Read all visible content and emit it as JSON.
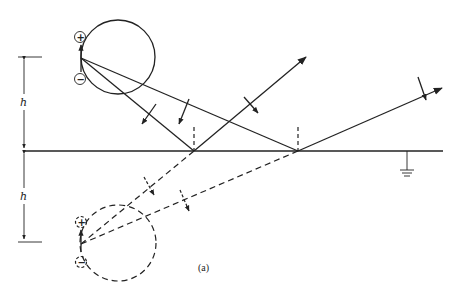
{
  "diagram": {
    "caption": "(a)",
    "height_label_upper": "h",
    "height_label_lower": "h",
    "ground_plane": {
      "y": 151,
      "x_start": 24,
      "x_end": 443
    },
    "real_dipole": {
      "position": [
        81,
        58
      ],
      "plus_sign": "+",
      "minus_sign": "−",
      "plus_at": [
        80,
        37
      ],
      "minus_at": [
        80,
        79
      ],
      "pattern_circle": {
        "cx": 118,
        "cy": 57,
        "r": 37,
        "style": "solid"
      }
    },
    "image_dipole": {
      "position": [
        81,
        244
      ],
      "plus_sign": "+",
      "minus_sign": "−",
      "plus_at": [
        81,
        222
      ],
      "minus_at": [
        81,
        262
      ],
      "pattern_circle": {
        "cx": 118,
        "cy": 243,
        "r": 38,
        "style": "dashed"
      }
    },
    "reflection_points": [
      [
        194,
        151
      ],
      [
        298,
        151
      ]
    ],
    "rays": [
      {
        "type": "direct",
        "from": [
          81,
          58
        ],
        "to": [
          194,
          151
        ]
      },
      {
        "type": "direct",
        "from": [
          81,
          58
        ],
        "to": [
          298,
          151
        ]
      },
      {
        "type": "reflected",
        "from": [
          194,
          151
        ],
        "to": [
          306,
          57
        ]
      },
      {
        "type": "reflected",
        "from": [
          298,
          151
        ],
        "to": [
          442,
          88
        ]
      },
      {
        "type": "image",
        "from": [
          81,
          244
        ],
        "to": [
          194,
          151
        ]
      },
      {
        "type": "image",
        "from": [
          81,
          244
        ],
        "to": [
          298,
          151
        ]
      }
    ],
    "normals": [
      {
        "x": 194,
        "y1": 128,
        "y2": 151
      },
      {
        "x": 298,
        "y1": 128,
        "y2": 151
      }
    ],
    "ground_symbol": {
      "x": 407,
      "y_top": 151
    },
    "dimension": {
      "x": 24,
      "top_y": 57,
      "mid_y": 151,
      "bottom_y": 242
    }
  }
}
